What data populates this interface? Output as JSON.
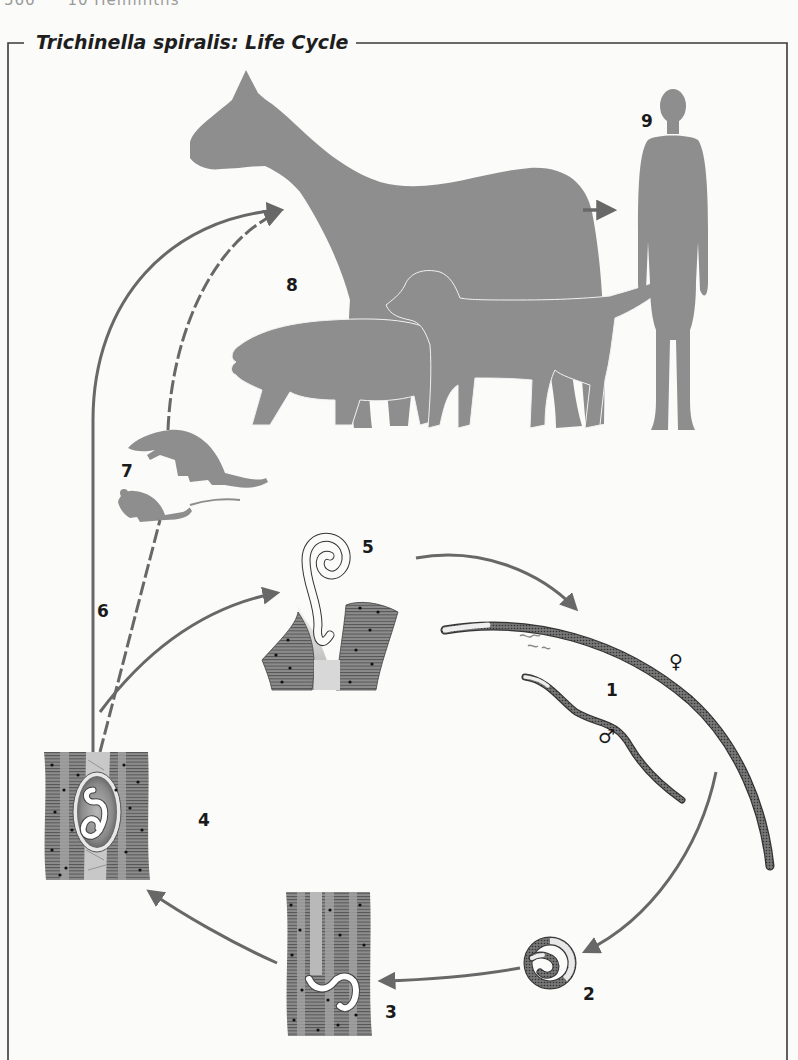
{
  "page_header": {
    "page_number": "566",
    "chapter": "10 Helminths"
  },
  "figure": {
    "title": "Trichinella spiralis: Life Cycle",
    "labels": {
      "stage_1": "1",
      "stage_2": "2",
      "stage_3": "3",
      "stage_4": "4",
      "stage_5": "5",
      "stage_6": "6",
      "stage_7": "7",
      "stage_8": "8",
      "stage_9": "9",
      "female_symbol": "♀",
      "male_symbol": "♂"
    },
    "icons": [
      "horse-silhouette",
      "pig-silhouette",
      "dog-silhouette",
      "human-silhouette",
      "rat-silhouette",
      "mouse-silhouette",
      "adult-female-worm",
      "adult-male-worm",
      "newborn-larva",
      "migrating-larva-in-muscle",
      "encysted-larva-in-muscle",
      "larva-in-intestinal-mucosa"
    ],
    "colors": {
      "silhouette": "#8e8e8e",
      "arrow": "#686868",
      "frame": "#3a3a3a",
      "text": "#1a1a1a",
      "background": "#fbfbfa"
    }
  }
}
